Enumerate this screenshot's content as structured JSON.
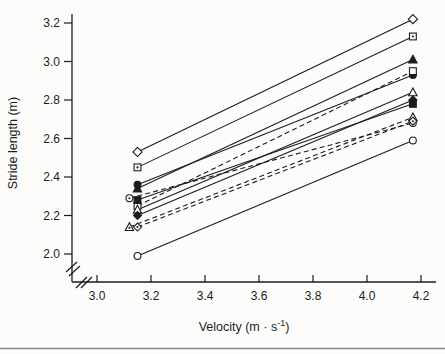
{
  "figure": {
    "background": "#fcfcfa",
    "ink_color": "#1c1c1c",
    "bottom_rule_color": "#8a8a88"
  },
  "chart_data": {
    "type": "line",
    "title": "",
    "xlabel": "Velocity (m · s⁻¹)",
    "xlabel_parts": {
      "base": "Velocity (m · s",
      "sup": "-1",
      "end": ")"
    },
    "ylabel": "Stride length (m)",
    "x_ticks": [
      "3.0",
      "3.2",
      "3.4",
      "3.6",
      "3.8",
      "4.0",
      "4.2"
    ],
    "x_tick_values": [
      3.0,
      3.2,
      3.4,
      3.6,
      3.8,
      4.0,
      4.2
    ],
    "y_ticks": [
      "2.0",
      "2.2",
      "2.4",
      "2.6",
      "2.8",
      "3.0",
      "3.2"
    ],
    "y_tick_values": [
      2.0,
      2.2,
      2.4,
      2.6,
      2.8,
      3.0,
      3.2
    ],
    "xlim": [
      2.93,
      4.25
    ],
    "ylim": [
      1.95,
      3.25
    ],
    "axis_breaks": {
      "x_axis": true,
      "y_axis": true
    },
    "grid": false,
    "legend": "none",
    "series": [
      {
        "name": "subject-diamond-open",
        "marker": "diamond-open",
        "line_style": "solid",
        "points": [
          [
            3.15,
            2.53
          ],
          [
            4.17,
            3.22
          ]
        ]
      },
      {
        "name": "subject-square-dot",
        "marker": "square-dot",
        "line_style": "solid",
        "points": [
          [
            3.15,
            2.45
          ],
          [
            4.17,
            3.13
          ]
        ]
      },
      {
        "name": "subject-triangle-filled",
        "marker": "triangle-filled",
        "line_style": "solid",
        "points": [
          [
            3.15,
            2.34
          ],
          [
            4.17,
            3.01
          ]
        ]
      },
      {
        "name": "subject-circle-filled",
        "marker": "circle-filled",
        "line_style": "solid",
        "points": [
          [
            3.15,
            2.36
          ],
          [
            4.17,
            2.93
          ]
        ]
      },
      {
        "name": "subject-square-open",
        "marker": "square-open",
        "line_style": "dashed",
        "points": [
          [
            3.15,
            2.25
          ],
          [
            4.17,
            2.95
          ]
        ]
      },
      {
        "name": "subject-triangle-open",
        "marker": "triangle-open",
        "line_style": "solid",
        "points": [
          [
            3.15,
            2.23
          ],
          [
            4.17,
            2.84
          ]
        ]
      },
      {
        "name": "subject-square-filled",
        "marker": "square-filled",
        "line_style": "solid",
        "points": [
          [
            3.15,
            2.28
          ],
          [
            4.17,
            2.78
          ]
        ]
      },
      {
        "name": "subject-diamond-filled",
        "marker": "diamond-filled",
        "line_style": "solid",
        "points": [
          [
            3.15,
            2.2
          ],
          [
            4.17,
            2.8
          ]
        ]
      },
      {
        "name": "subject-circle-dot",
        "marker": "circle-dot",
        "line_style": "dashed",
        "points": [
          [
            3.12,
            2.29
          ],
          [
            4.17,
            2.68
          ]
        ]
      },
      {
        "name": "subject-triangle-dot",
        "marker": "triangle-dot",
        "line_style": "dashed",
        "points": [
          [
            3.12,
            2.14
          ],
          [
            4.17,
            2.71
          ]
        ]
      },
      {
        "name": "subject-diamond-dot",
        "marker": "diamond-dot",
        "line_style": "dashed",
        "points": [
          [
            3.15,
            2.14
          ],
          [
            4.17,
            2.69
          ]
        ]
      },
      {
        "name": "subject-circle-open",
        "marker": "circle-open",
        "line_style": "solid",
        "points": [
          [
            3.15,
            1.99
          ],
          [
            4.17,
            2.59
          ]
        ]
      }
    ]
  }
}
